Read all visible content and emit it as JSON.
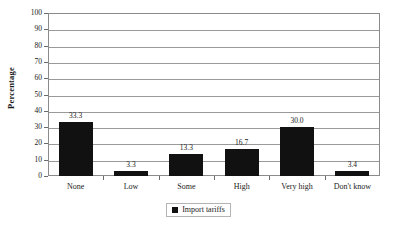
{
  "chart_data": {
    "type": "bar",
    "title": "",
    "subtitle": "",
    "xlabel": "",
    "ylabel": "Percentage",
    "categories": [
      "None",
      "Low",
      "Some",
      "High",
      "Very high",
      "Don't know"
    ],
    "values": [
      33.3,
      3.3,
      13.3,
      16.7,
      30.0,
      3.4
    ],
    "value_labels": [
      "33.3",
      "3.3",
      "13.3",
      "16.7",
      "30.0",
      "3.4"
    ],
    "series": [
      {
        "name": "Import tariffs",
        "values": [
          33.3,
          3.3,
          13.3,
          16.7,
          30.0,
          3.4
        ],
        "color": "#111111"
      }
    ],
    "ylim": [
      0,
      100
    ],
    "ytick_step": 10,
    "ytick_labels": [
      "0",
      "10",
      "20",
      "30",
      "40",
      "50",
      "60",
      "70",
      "80",
      "90",
      "100"
    ],
    "grid": true,
    "grid_axis": "y",
    "legend": {
      "position": "bottom-center",
      "entries": [
        {
          "label": "Import tariffs",
          "marker": "filled-square",
          "color": "#111111"
        }
      ]
    },
    "frame": true,
    "bar_color": "#111111",
    "gridline_color": "#9a9a9a",
    "frame_color": "#8a8a8a"
  }
}
